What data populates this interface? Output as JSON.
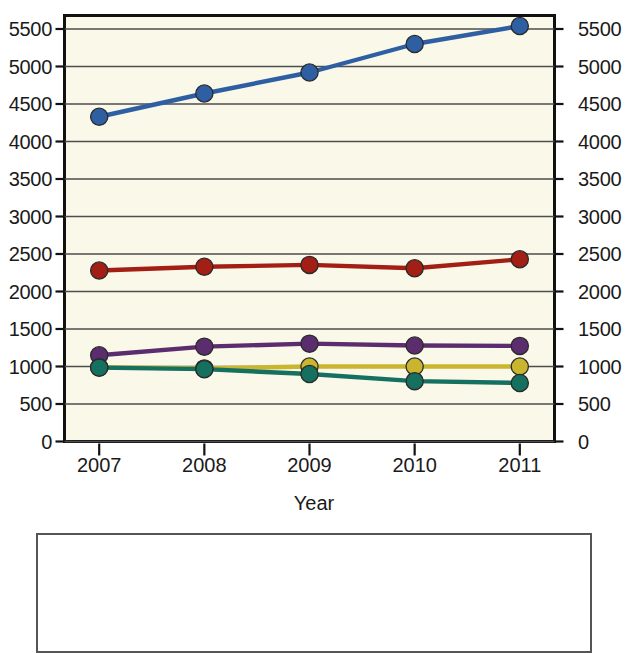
{
  "chart_data": {
    "type": "line",
    "title": "",
    "subtitle": "",
    "xlabel": "Year",
    "ylabel": "",
    "categories": [
      "2007",
      "2008",
      "2009",
      "2010",
      "2011"
    ],
    "x": [
      2007,
      2008,
      2009,
      2010,
      2011
    ],
    "xlim": [
      2006.67,
      2011.33
    ],
    "ylim": [
      0,
      5680
    ],
    "ytick_values": [
      0,
      500,
      1000,
      1500,
      2000,
      2500,
      3000,
      3500,
      4000,
      4500,
      5000,
      5500
    ],
    "ytick_labels": [
      "0",
      "500",
      "1000",
      "1500",
      "2000",
      "2500",
      "3000",
      "3500",
      "4000",
      "4500",
      "5000",
      "5500"
    ],
    "xtick_labels": [
      "2007",
      "2008",
      "2009",
      "2010",
      "2011"
    ],
    "grid": true,
    "grid_axis": "y",
    "dual_y_axis": true,
    "legend_position": "bottom",
    "legend_visible_partially": true,
    "markers": "filled-circle",
    "plot_background": "#FAF8E8",
    "series": [
      {
        "name": "series-blue",
        "color": "#2E5FA3",
        "values": [
          4330,
          4640,
          4920,
          5300,
          5540
        ]
      },
      {
        "name": "series-red",
        "color": "#A31E14",
        "values": [
          2280,
          2330,
          2355,
          2310,
          2430
        ]
      },
      {
        "name": "series-purple",
        "color": "#5B2D6E",
        "values": [
          1150,
          1265,
          1305,
          1280,
          1275
        ]
      },
      {
        "name": "series-yellow",
        "color": "#C9B52E",
        "values": [
          990,
          975,
          1000,
          1000,
          1000
        ]
      },
      {
        "name": "series-teal",
        "color": "#15705F",
        "values": [
          985,
          965,
          900,
          805,
          780
        ]
      }
    ]
  },
  "axes": {
    "left_label_color": "#1a1a1a",
    "right_label_color": "#1a1a1a",
    "frame_color": "#111111",
    "gridline_color": "#4d4d4d"
  }
}
